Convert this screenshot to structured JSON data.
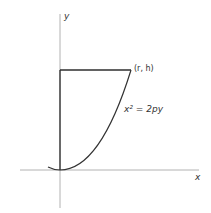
{
  "diagram": {
    "axes": {
      "x_label": "x",
      "y_label": "y"
    },
    "point_label": "(r, h)",
    "curve_label": "x² = 2py",
    "colors": {
      "axis": "#9a9a9a",
      "curve": "#3a3a3a",
      "background": "#ffffff"
    }
  }
}
